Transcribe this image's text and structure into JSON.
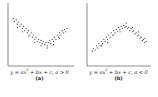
{
  "figure": {
    "panels": [
      {
        "id": "a",
        "label": "(a)",
        "equation_pre": "y = ax",
        "equation_sup": "2",
        "equation_post": " + bx + c, a > 0"
      },
      {
        "id": "b",
        "label": "(b)",
        "equation_pre": "y = ax",
        "equation_sup": "2",
        "equation_post": " + bx + c, a < 0"
      }
    ],
    "colors": {
      "axis": "#8a8a8a",
      "points": "#333333",
      "text": "#222222"
    }
  },
  "chart_data": [
    {
      "type": "scatter",
      "title": "",
      "caption": "y = ax^2 + bx + c, a > 0",
      "label": "(a)",
      "shape": "upward-opening parabola (convex)",
      "xlabel": "",
      "ylabel": "",
      "grid": false,
      "points": [
        [
          0.05,
          0.8
        ],
        [
          0.07,
          0.75
        ],
        [
          0.1,
          0.78
        ],
        [
          0.12,
          0.7
        ],
        [
          0.14,
          0.74
        ],
        [
          0.16,
          0.66
        ],
        [
          0.18,
          0.7
        ],
        [
          0.2,
          0.62
        ],
        [
          0.22,
          0.66
        ],
        [
          0.24,
          0.58
        ],
        [
          0.26,
          0.62
        ],
        [
          0.28,
          0.54
        ],
        [
          0.3,
          0.58
        ],
        [
          0.32,
          0.5
        ],
        [
          0.34,
          0.54
        ],
        [
          0.36,
          0.46
        ],
        [
          0.38,
          0.5
        ],
        [
          0.4,
          0.42
        ],
        [
          0.42,
          0.46
        ],
        [
          0.44,
          0.38
        ],
        [
          0.46,
          0.42
        ],
        [
          0.48,
          0.36
        ],
        [
          0.5,
          0.4
        ],
        [
          0.52,
          0.34
        ],
        [
          0.54,
          0.38
        ],
        [
          0.56,
          0.32
        ],
        [
          0.58,
          0.36
        ],
        [
          0.6,
          0.3
        ],
        [
          0.62,
          0.36
        ],
        [
          0.64,
          0.4
        ],
        [
          0.66,
          0.34
        ],
        [
          0.68,
          0.42
        ],
        [
          0.7,
          0.38
        ],
        [
          0.72,
          0.46
        ],
        [
          0.74,
          0.42
        ],
        [
          0.76,
          0.5
        ],
        [
          0.78,
          0.46
        ],
        [
          0.8,
          0.54
        ],
        [
          0.82,
          0.5
        ],
        [
          0.84,
          0.58
        ],
        [
          0.86,
          0.54
        ],
        [
          0.88,
          0.6
        ],
        [
          0.9,
          0.56
        ],
        [
          0.92,
          0.62
        ],
        [
          0.12,
          0.64
        ],
        [
          0.2,
          0.56
        ],
        [
          0.3,
          0.48
        ],
        [
          0.4,
          0.36
        ],
        [
          0.5,
          0.3
        ],
        [
          0.6,
          0.26
        ],
        [
          0.7,
          0.32
        ],
        [
          0.8,
          0.44
        ]
      ]
    },
    {
      "type": "scatter",
      "title": "",
      "caption": "y = ax^2 + bx + c, a < 0",
      "label": "(b)",
      "shape": "downward-opening parabola (concave)",
      "xlabel": "",
      "ylabel": "",
      "grid": false,
      "points": [
        [
          0.05,
          0.2
        ],
        [
          0.07,
          0.25
        ],
        [
          0.1,
          0.22
        ],
        [
          0.12,
          0.3
        ],
        [
          0.14,
          0.26
        ],
        [
          0.16,
          0.34
        ],
        [
          0.18,
          0.3
        ],
        [
          0.2,
          0.38
        ],
        [
          0.22,
          0.34
        ],
        [
          0.24,
          0.42
        ],
        [
          0.26,
          0.38
        ],
        [
          0.28,
          0.46
        ],
        [
          0.3,
          0.42
        ],
        [
          0.32,
          0.5
        ],
        [
          0.34,
          0.46
        ],
        [
          0.36,
          0.54
        ],
        [
          0.38,
          0.5
        ],
        [
          0.4,
          0.58
        ],
        [
          0.42,
          0.54
        ],
        [
          0.44,
          0.6
        ],
        [
          0.46,
          0.56
        ],
        [
          0.48,
          0.64
        ],
        [
          0.5,
          0.6
        ],
        [
          0.52,
          0.66
        ],
        [
          0.54,
          0.62
        ],
        [
          0.56,
          0.68
        ],
        [
          0.58,
          0.64
        ],
        [
          0.6,
          0.66
        ],
        [
          0.62,
          0.62
        ],
        [
          0.64,
          0.64
        ],
        [
          0.66,
          0.58
        ],
        [
          0.68,
          0.62
        ],
        [
          0.7,
          0.56
        ],
        [
          0.72,
          0.58
        ],
        [
          0.74,
          0.52
        ],
        [
          0.76,
          0.54
        ],
        [
          0.78,
          0.48
        ],
        [
          0.8,
          0.5
        ],
        [
          0.82,
          0.44
        ],
        [
          0.84,
          0.46
        ],
        [
          0.86,
          0.4
        ],
        [
          0.88,
          0.42
        ],
        [
          0.9,
          0.36
        ],
        [
          0.92,
          0.38
        ],
        [
          0.2,
          0.3
        ],
        [
          0.3,
          0.36
        ],
        [
          0.4,
          0.5
        ],
        [
          0.5,
          0.56
        ],
        [
          0.6,
          0.72
        ],
        [
          0.7,
          0.64
        ],
        [
          0.8,
          0.56
        ],
        [
          0.9,
          0.44
        ]
      ]
    }
  ]
}
